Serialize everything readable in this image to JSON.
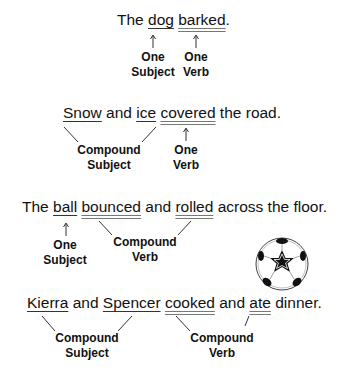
{
  "sentences": [
    {
      "parts": [
        "The ",
        "dog",
        " ",
        "barked",
        "."
      ],
      "subjects": [
        "dog"
      ],
      "verbs": [
        "barked"
      ],
      "labels": {
        "subject": [
          "One",
          "Subject"
        ],
        "verb": [
          "One",
          "Verb"
        ]
      }
    },
    {
      "parts": [
        "Snow",
        " and ",
        "ice",
        " ",
        "covered",
        " the road."
      ],
      "subjects": [
        "Snow",
        "ice"
      ],
      "verbs": [
        "covered"
      ],
      "labels": {
        "subject": [
          "Compound",
          "Subject"
        ],
        "verb": [
          "One",
          "Verb"
        ]
      }
    },
    {
      "parts": [
        "The ",
        "ball",
        " ",
        "bounced",
        " and ",
        "rolled",
        " across the floor."
      ],
      "subjects": [
        "ball"
      ],
      "verbs": [
        "bounced",
        "rolled"
      ],
      "labels": {
        "subject": [
          "One",
          "Subject"
        ],
        "verb": [
          "Compound",
          "Verb"
        ]
      }
    },
    {
      "parts": [
        "Kierra",
        " and ",
        "Spencer",
        " ",
        "cooked",
        " and ",
        "ate",
        " dinner."
      ],
      "subjects": [
        "Kierra",
        "Spencer"
      ],
      "verbs": [
        "cooked",
        "ate"
      ],
      "labels": {
        "subject": [
          "Compound",
          "Subject"
        ],
        "verb": [
          "Compound",
          "Verb"
        ]
      }
    }
  ],
  "illustration": "soccer-ball-icon",
  "colors": {
    "text": "#111111",
    "subject_underline": "#333333",
    "verb_underline": "#777777",
    "background": "#ffffff"
  }
}
